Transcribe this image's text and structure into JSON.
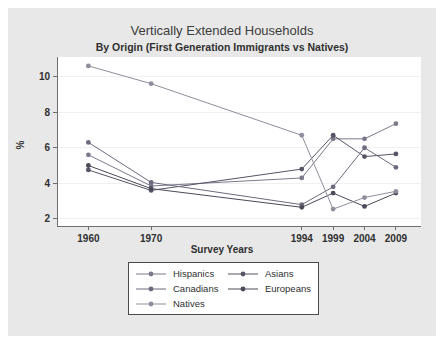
{
  "figure": {
    "background_color": "#e8e8e8",
    "plot_background_color": "#ffffff",
    "axis_color": "#6e6e6e"
  },
  "chart_data": {
    "type": "line",
    "title": "Vertically Extended Households",
    "subtitle": "By Origin (First Generation Immigrants vs Natives)",
    "xlabel": "Survey Years",
    "ylabel": "%",
    "categories": [
      "1960",
      "1970",
      "1994",
      "1999",
      "2004",
      "2009"
    ],
    "x": [
      1960,
      1970,
      1994,
      1999,
      2004,
      2009
    ],
    "xlim": [
      1955,
      2013
    ],
    "ylim": [
      1.6,
      11.1
    ],
    "yticks": [
      2,
      4,
      6,
      8,
      10
    ],
    "ytick_labels": [
      "2",
      "4",
      "6",
      "8",
      "10"
    ],
    "xtick_labels": [
      "1960",
      "1970",
      "1994",
      "1999",
      "2004",
      "2009"
    ],
    "grid": false,
    "legend_position": "below",
    "series": [
      {
        "name": "Hispanics",
        "color": "#7a7a8c",
        "values": [
          5.6,
          3.85,
          4.3,
          6.5,
          6.5,
          7.35
        ]
      },
      {
        "name": "Asians",
        "color": "#555566",
        "values": [
          4.75,
          3.6,
          4.8,
          6.7,
          5.5,
          5.65
        ]
      },
      {
        "name": "Canadians",
        "color": "#6b6b7d",
        "values": [
          6.3,
          4.05,
          2.8,
          3.8,
          6.0,
          4.9
        ]
      },
      {
        "name": "Europeans",
        "color": "#4a4a58",
        "values": [
          5.0,
          3.7,
          2.65,
          3.45,
          2.7,
          3.45
        ]
      },
      {
        "name": "Natives",
        "color": "#8e8e9c",
        "values": [
          10.6,
          9.6,
          6.7,
          2.55,
          3.2,
          3.55
        ]
      }
    ],
    "legend_entries": [
      {
        "label": "Hispanics",
        "color": "#7a7a8c"
      },
      {
        "label": "Asians",
        "color": "#555566"
      },
      {
        "label": "Canadians",
        "color": "#6b6b7d"
      },
      {
        "label": "Europeans",
        "color": "#4a4a58"
      },
      {
        "label": "Natives",
        "color": "#8e8e9c"
      }
    ]
  }
}
